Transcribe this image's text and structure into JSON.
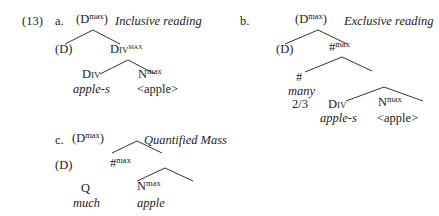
{
  "example": {
    "number": "(13)",
    "a": {
      "label": "a.",
      "root": {
        "base": "(D",
        "sup": "max",
        "close": ")"
      },
      "reading": "Inclusive reading",
      "left": "(D)",
      "right": {
        "base": "Div",
        "sup": "max"
      },
      "div": "Div",
      "div_word": "apple-s",
      "n": {
        "base": "N",
        "sup": "max"
      },
      "n_word": "<apple>"
    },
    "b": {
      "label": "b.",
      "root": {
        "base": "(D",
        "sup": "max",
        "close": ")"
      },
      "reading": "Exclusive reading",
      "left": "(D)",
      "right": {
        "base": "#",
        "sup": "max"
      },
      "hash": "#",
      "hash_word1": "many",
      "hash_word2": "2/3",
      "div": "Div",
      "div_word": "apple-s",
      "n": {
        "base": "N",
        "sup": "max"
      },
      "n_word": "<apple>"
    },
    "c": {
      "label": "c.",
      "root": {
        "base": "(D",
        "sup": "max",
        "close": ")"
      },
      "reading": "Quantified Mass",
      "left": "(D)",
      "right": {
        "base": "#",
        "sup": "max"
      },
      "q": "Q",
      "q_word": "much",
      "n": {
        "base": "N",
        "sup": "max"
      },
      "n_word": "apple"
    }
  }
}
